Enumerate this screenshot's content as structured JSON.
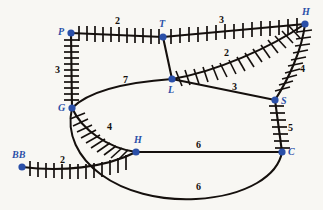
{
  "figure": {
    "background_color": "#f8f7f3",
    "node_color": "#2a4fa8",
    "edge_color": "#15100d",
    "label_color": "#15100d"
  },
  "nodes": [
    {
      "id": "P",
      "label": "P",
      "x": 71,
      "y": 33,
      "label_x": 58,
      "label_y": 27
    },
    {
      "id": "T",
      "label": "T",
      "x": 163,
      "y": 37,
      "label_x": 159,
      "label_y": 19
    },
    {
      "id": "H2",
      "label": "H",
      "x": 305,
      "y": 24,
      "label_x": 302,
      "label_y": 7
    },
    {
      "id": "G",
      "label": "G",
      "x": 72,
      "y": 108,
      "label_x": 58,
      "label_y": 103
    },
    {
      "id": "L",
      "label": "L",
      "x": 172,
      "y": 79,
      "label_x": 168,
      "label_y": 85
    },
    {
      "id": "S",
      "label": "S",
      "x": 275,
      "y": 100,
      "label_x": 281,
      "label_y": 96
    },
    {
      "id": "H1",
      "label": "H",
      "x": 136,
      "y": 152,
      "label_x": 134,
      "label_y": 135
    },
    {
      "id": "C",
      "label": "C",
      "x": 282,
      "y": 152,
      "label_x": 288,
      "label_y": 147
    },
    {
      "id": "BB",
      "label": "BB",
      "x": 22,
      "y": 167,
      "label_x": 12,
      "label_y": 150
    }
  ],
  "edges": [
    {
      "id": "P-T",
      "from": "P",
      "to": "T",
      "weight": "2",
      "style": "hatched",
      "label_x": 115,
      "label_y": 16
    },
    {
      "id": "T-H2",
      "from": "T",
      "to": "H2",
      "weight": "3",
      "style": "hatched",
      "label_x": 219,
      "label_y": 15
    },
    {
      "id": "P-G",
      "from": "P",
      "to": "G",
      "weight": "3",
      "style": "hatched",
      "label_x": 55,
      "label_y": 65
    },
    {
      "id": "T-L",
      "from": "T",
      "to": "L",
      "weight": "",
      "style": "plain",
      "label_x": 0,
      "label_y": 0
    },
    {
      "id": "G-L",
      "from": "G",
      "to": "L",
      "weight": "7",
      "style": "plain",
      "label_x": 123,
      "label_y": 75
    },
    {
      "id": "L-H2",
      "from": "L",
      "to": "H2",
      "weight": "2",
      "style": "hatched",
      "label_x": 224,
      "label_y": 48
    },
    {
      "id": "L-S",
      "from": "L",
      "to": "S",
      "weight": "3",
      "style": "plain",
      "label_x": 232,
      "label_y": 82
    },
    {
      "id": "H2-S",
      "from": "H2",
      "to": "S",
      "weight": "4",
      "style": "hatched",
      "label_x": 300,
      "label_y": 64
    },
    {
      "id": "S-C",
      "from": "S",
      "to": "C",
      "weight": "5",
      "style": "hatched",
      "label_x": 288,
      "label_y": 123
    },
    {
      "id": "G-H1",
      "from": "G",
      "to": "H1",
      "weight": "4",
      "style": "hatched",
      "label_x": 107,
      "label_y": 122
    },
    {
      "id": "BB-H1",
      "from": "BB",
      "to": "H1",
      "weight": "2",
      "style": "hatched",
      "label_x": 60,
      "label_y": 155
    },
    {
      "id": "H1-C",
      "from": "H1",
      "to": "C",
      "weight": "6",
      "style": "plain",
      "label_x": 196,
      "label_y": 140
    },
    {
      "id": "G-C",
      "from": "G",
      "to": "C",
      "weight": "6",
      "style": "plain",
      "label_x": 196,
      "label_y": 182
    }
  ]
}
